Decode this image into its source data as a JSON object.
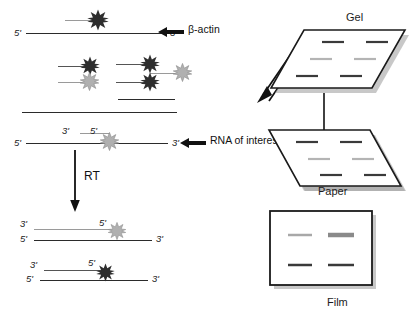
{
  "diagram": {
    "left_panel": {
      "top_strand": {
        "five_prime": "5'",
        "three_prime": "3'",
        "star": "dark-star-icon"
      },
      "beta_actin_annotation": {
        "label": "β-actin",
        "arrow": "left-arrow-icon"
      },
      "fragment_cluster": {
        "items": [
          {
            "star": "dark-star-icon"
          },
          {
            "star": "light-star-icon"
          },
          {
            "star": "dark-star-icon"
          },
          {
            "star": "dark-star-icon"
          },
          {
            "star": "light-star-icon"
          }
        ]
      },
      "rna_strand": {
        "five_prime_left": "5'",
        "three_prime_right": "3'",
        "primer_three_prime": "3'",
        "primer_five_prime": "5'",
        "star": "light-star-icon"
      },
      "rna_annotation": {
        "label": "RNA of interest",
        "arrow": "left-arrow-icon"
      },
      "rt_step": {
        "label": "RT",
        "arrow": "down-arrow-icon"
      },
      "product_light": {
        "top_three_prime": "3'",
        "top_five_prime": "5'",
        "bottom_five_prime": "5'",
        "bottom_three_prime": "3'",
        "star": "light-star-icon"
      },
      "product_dark": {
        "top_three_prime": "3'",
        "top_five_prime": "5'",
        "bottom_five_prime": "5'",
        "bottom_three_prime": "3'",
        "star": "dark-star-icon"
      }
    },
    "right_panel": {
      "gel": {
        "caption": "Gel",
        "run_arrow": "diagonal-down-left-arrow-icon",
        "bands": [
          {
            "row": 1,
            "col": 1,
            "shade": "#3a3a3a"
          },
          {
            "row": 1,
            "col": 2,
            "shade": "#3a3a3a"
          },
          {
            "row": 2,
            "col": 1,
            "shade": "#b4b4b4"
          },
          {
            "row": 2,
            "col": 2,
            "shade": "#b4b4b4"
          },
          {
            "row": 3,
            "col": 1,
            "shade": "#3a3a3a"
          },
          {
            "row": 3,
            "col": 2,
            "shade": "#3a3a3a"
          }
        ]
      },
      "transfer_arrow": "down-arrow-icon",
      "paper": {
        "caption": "Paper",
        "bands": [
          {
            "row": 1,
            "col": 1,
            "shade": "#3a3a3a"
          },
          {
            "row": 1,
            "col": 2,
            "shade": "#3a3a3a"
          },
          {
            "row": 2,
            "col": 1,
            "shade": "#b4b4b4"
          },
          {
            "row": 2,
            "col": 2,
            "shade": "#b4b4b4"
          },
          {
            "row": 3,
            "col": 1,
            "shade": "#3a3a3a"
          },
          {
            "row": 3,
            "col": 2,
            "shade": "#3a3a3a"
          }
        ]
      },
      "film": {
        "caption": "Film",
        "bands": [
          {
            "row": 1,
            "col": 1,
            "shade": "#a8a8a8",
            "thickness": 2.5
          },
          {
            "row": 1,
            "col": 2,
            "shade": "#8a8a8a",
            "thickness": 4.5
          },
          {
            "row": 2,
            "col": 1,
            "shade": "#3a3a3a",
            "thickness": 2.5
          },
          {
            "row": 2,
            "col": 2,
            "shade": "#3a3a3a",
            "thickness": 2.5
          }
        ]
      }
    },
    "colors": {
      "dark_star": "#2e2e2e",
      "light_star": "#b0b0b0",
      "strand_dark": "#2b2b2b",
      "strand_gray": "#9a9a9a",
      "outline": "#1a1a1a",
      "shadow": "#9b9b9b"
    }
  }
}
